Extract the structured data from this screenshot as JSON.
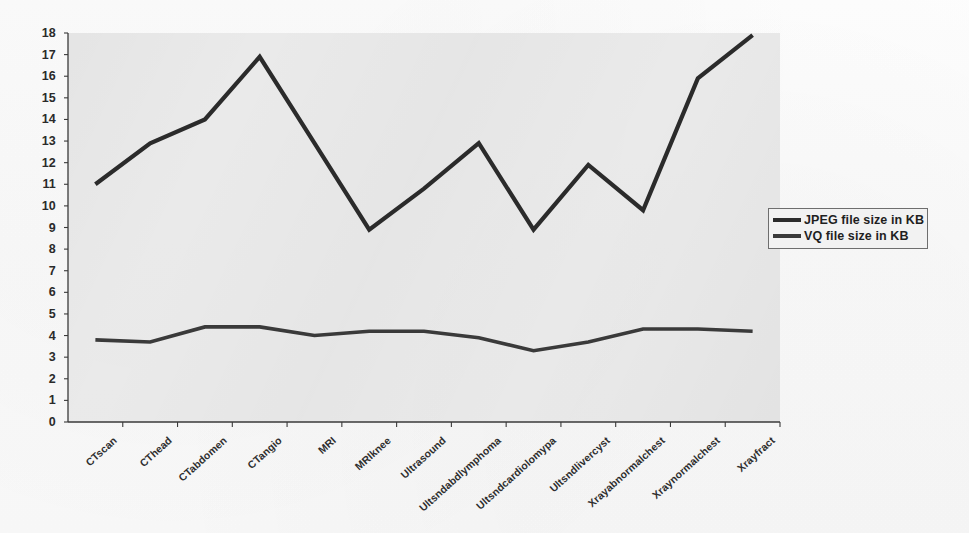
{
  "chart_data": {
    "type": "line",
    "title": "",
    "xlabel": "",
    "ylabel": "",
    "ylim": [
      0,
      18
    ],
    "grid": false,
    "legend_position": "right",
    "categories": [
      "CTscan",
      "CThead",
      "CTabdomen",
      "CTangio",
      "MRI",
      "MRIknee",
      "Ultrasound",
      "Ultsndabdlymphoma",
      "Ultsndcardiolomypa",
      "Ultsndlivercyst",
      "Xrayabnormalchest",
      "Xraynormalchest",
      "Xrayfract"
    ],
    "ytick_labels": [
      "0",
      "1",
      "2",
      "3",
      "4",
      "5",
      "6",
      "7",
      "8",
      "9",
      "10",
      "11",
      "12",
      "13",
      "14",
      "15",
      "16",
      "17",
      "18"
    ],
    "series": [
      {
        "name": "JPEG file size in KB",
        "color": "#2b2b2b",
        "values": [
          11.0,
          12.9,
          14.0,
          16.9,
          12.9,
          8.9,
          10.8,
          12.9,
          8.9,
          11.9,
          9.8,
          15.9,
          17.9
        ]
      },
      {
        "name": "VQ file size in KB",
        "color": "#3a3a3a",
        "values": [
          3.8,
          3.7,
          4.4,
          4.4,
          4.0,
          4.2,
          4.2,
          3.9,
          3.3,
          3.7,
          4.3,
          4.3,
          4.2
        ]
      }
    ]
  },
  "legend": {
    "items": [
      {
        "label": "JPEG file size in KB"
      },
      {
        "label": "VQ file size in KB"
      }
    ]
  },
  "axes": {
    "y_axis_name": "y-axis",
    "x_axis_name": "x-axis"
  }
}
